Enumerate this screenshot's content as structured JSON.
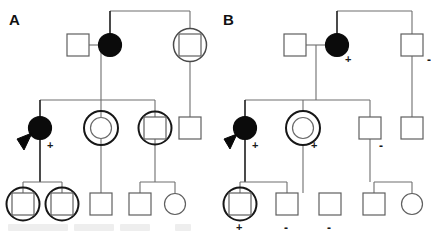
{
  "figure": {
    "type": "pedigree-chart",
    "width": 431,
    "height": 238,
    "background": "#ffffff",
    "line_color": "#6e6e6e",
    "filled_color": "#0b0b0b"
  },
  "panels": [
    {
      "id": "A",
      "label": "A",
      "label_x": 9,
      "label_y": 11,
      "generations": [
        {
          "id": "I",
          "individuals": [
            {
              "name": "a-i-1",
              "shape": "square",
              "fill": "open",
              "ring": "none",
              "cx": 78,
              "cy": 45,
              "size": 22,
              "mark": ""
            },
            {
              "name": "a-i-2",
              "shape": "circle",
              "fill": "filled",
              "ring": "none",
              "cx": 110,
              "cy": 45,
              "size": 22,
              "mark": ""
            },
            {
              "name": "a-i-3",
              "shape": "square",
              "fill": "open",
              "ring": "circle",
              "cx": 190,
              "cy": 45,
              "size": 22,
              "mark": ""
            }
          ]
        },
        {
          "id": "II",
          "individuals": [
            {
              "name": "a-ii-1",
              "shape": "circle",
              "fill": "filled",
              "ring": "none",
              "cx": 40,
              "cy": 128,
              "size": 22,
              "mark": "+",
              "proband": true
            },
            {
              "name": "a-ii-2",
              "shape": "circle",
              "fill": "open",
              "ring": "circle",
              "cx": 101,
              "cy": 128,
              "size": 22,
              "mark": ""
            },
            {
              "name": "a-ii-3",
              "shape": "square",
              "fill": "open",
              "ring": "circle",
              "cx": 155,
              "cy": 128,
              "size": 22,
              "mark": ""
            },
            {
              "name": "a-ii-4",
              "shape": "square",
              "fill": "open",
              "ring": "none",
              "cx": 190,
              "cy": 128,
              "size": 22,
              "mark": ""
            }
          ]
        },
        {
          "id": "III",
          "individuals": [
            {
              "name": "a-iii-1",
              "shape": "square",
              "fill": "open",
              "ring": "circle",
              "cx": 23,
              "cy": 204,
              "size": 22,
              "mark": ""
            },
            {
              "name": "a-iii-2",
              "shape": "square",
              "fill": "open",
              "ring": "circle",
              "cx": 62,
              "cy": 204,
              "size": 22,
              "mark": ""
            },
            {
              "name": "a-iii-3",
              "shape": "square",
              "fill": "open",
              "ring": "none",
              "cx": 101,
              "cy": 204,
              "size": 22,
              "mark": ""
            },
            {
              "name": "a-iii-4",
              "shape": "square",
              "fill": "open",
              "ring": "none",
              "cx": 140,
              "cy": 204,
              "size": 22,
              "mark": ""
            },
            {
              "name": "a-iii-5",
              "shape": "circle",
              "fill": "open",
              "ring": "none",
              "cx": 175,
              "cy": 204,
              "size": 20,
              "mark": ""
            }
          ]
        }
      ]
    },
    {
      "id": "B",
      "label": "B",
      "label_x": 223,
      "label_y": 11,
      "generations": [
        {
          "id": "I",
          "individuals": [
            {
              "name": "b-i-1",
              "shape": "square",
              "fill": "open",
              "ring": "none",
              "cx": 295,
              "cy": 45,
              "size": 22,
              "mark": ""
            },
            {
              "name": "b-i-2",
              "shape": "circle",
              "fill": "filled",
              "ring": "none",
              "cx": 337,
              "cy": 45,
              "size": 22,
              "mark": "+"
            },
            {
              "name": "b-i-3",
              "shape": "square",
              "fill": "open",
              "ring": "none",
              "cx": 412,
              "cy": 45,
              "size": 22,
              "mark": "-"
            }
          ]
        },
        {
          "id": "II",
          "individuals": [
            {
              "name": "b-ii-1",
              "shape": "circle",
              "fill": "filled",
              "ring": "none",
              "cx": 245,
              "cy": 128,
              "size": 22,
              "mark": "+",
              "proband": true
            },
            {
              "name": "b-ii-2",
              "shape": "circle",
              "fill": "open",
              "ring": "circle",
              "cx": 303,
              "cy": 128,
              "size": 22,
              "mark": "+"
            },
            {
              "name": "b-ii-3",
              "shape": "square",
              "fill": "open",
              "ring": "none",
              "cx": 370,
              "cy": 128,
              "size": 22,
              "mark": "-"
            },
            {
              "name": "b-ii-4",
              "shape": "square",
              "fill": "open",
              "ring": "none",
              "cx": 412,
              "cy": 128,
              "size": 22,
              "mark": ""
            }
          ]
        },
        {
          "id": "III",
          "individuals": [
            {
              "name": "b-iii-1",
              "shape": "square",
              "fill": "open",
              "ring": "circle",
              "cx": 240,
              "cy": 204,
              "size": 22,
              "mark": "+"
            },
            {
              "name": "b-iii-2",
              "shape": "square",
              "fill": "open",
              "ring": "none",
              "cx": 287,
              "cy": 204,
              "size": 22,
              "mark": "-"
            },
            {
              "name": "b-iii-3",
              "shape": "square",
              "fill": "open",
              "ring": "none",
              "cx": 330,
              "cy": 204,
              "size": 22,
              "mark": "-"
            },
            {
              "name": "b-iii-4",
              "shape": "square",
              "fill": "open",
              "ring": "none",
              "cx": 374,
              "cy": 204,
              "size": 22,
              "mark": ""
            },
            {
              "name": "b-iii-5",
              "shape": "circle",
              "fill": "open",
              "ring": "none",
              "cx": 412,
              "cy": 204,
              "size": 20,
              "mark": ""
            }
          ]
        }
      ]
    }
  ],
  "marks": {
    "plus": "+",
    "minus": "-"
  },
  "legend_marks": [
    {
      "name": "mark-a-ii-1",
      "text": "+",
      "x": 47,
      "y": 146
    },
    {
      "name": "mark-b-i-2",
      "text": "+",
      "x": 345,
      "y": 60
    },
    {
      "name": "mark-b-i-3",
      "text": "-",
      "x": 428,
      "y": 60
    },
    {
      "name": "mark-b-ii-1",
      "text": "+",
      "x": 252,
      "y": 146
    },
    {
      "name": "mark-b-ii-2",
      "text": "+",
      "x": 311,
      "y": 146
    },
    {
      "name": "mark-b-ii-3",
      "text": "-",
      "x": 378,
      "y": 146
    },
    {
      "name": "mark-b-iii-1",
      "text": "+",
      "x": 236,
      "y": 224
    },
    {
      "name": "mark-b-iii-2",
      "text": "-",
      "x": 284,
      "y": 224
    },
    {
      "name": "mark-b-iii-3",
      "text": "-",
      "x": 327,
      "y": 224
    }
  ]
}
